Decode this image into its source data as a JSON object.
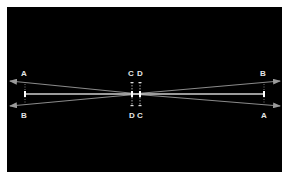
{
  "diagram": {
    "background": "#000000",
    "line_color": "#8a8a8a",
    "center_line_color": "#cfcfcf",
    "labels": {
      "left_top": "A",
      "left_bottom": "B",
      "center_top_left": "C",
      "center_top_right": "D",
      "center_bottom_left": "D",
      "center_bottom_right": "C",
      "right_top": "B",
      "right_bottom": "A"
    }
  }
}
